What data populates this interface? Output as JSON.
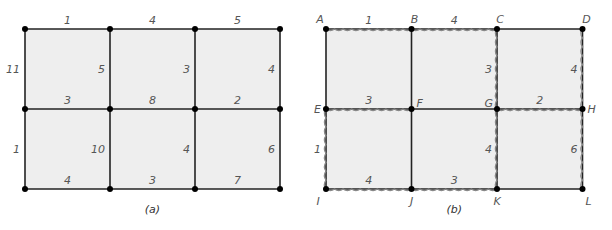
{
  "panels": [
    {
      "id": "a",
      "caption": "(a)",
      "origin": [
        25,
        29
      ],
      "cell_w": 85,
      "cell_h": 80,
      "cols": 3,
      "rows": 2,
      "node_labels": [],
      "horizontal_weights": [
        [
          "1",
          "4",
          "5"
        ],
        [
          "3",
          "8",
          "2"
        ],
        [
          "4",
          "3",
          "7"
        ]
      ],
      "vertical_weights": [
        [
          "11",
          "5",
          "3",
          "4"
        ],
        [
          "1",
          "10",
          "4",
          "6"
        ]
      ],
      "highlighted_h": [],
      "highlighted_v": []
    },
    {
      "id": "b",
      "caption": "(b)",
      "origin": [
        326,
        29
      ],
      "cell_w": 85.5,
      "cell_h": 80,
      "cols": 3,
      "rows": 2,
      "node_labels": [
        [
          "A",
          "B",
          "C",
          "D"
        ],
        [
          "E",
          "F",
          "G",
          "H"
        ],
        [
          "I",
          "J",
          "K",
          "L"
        ]
      ],
      "horizontal_weights": [
        [
          "1",
          "4",
          ""
        ],
        [
          "3",
          "",
          "2"
        ],
        [
          "4",
          "3",
          ""
        ]
      ],
      "vertical_weights": [
        [
          "",
          "",
          "3",
          "4"
        ],
        [
          "1",
          "",
          "4",
          "6"
        ]
      ],
      "highlighted_h": [
        [
          0,
          0
        ],
        [
          0,
          1
        ],
        [
          1,
          0
        ],
        [
          1,
          2
        ],
        [
          2,
          0
        ],
        [
          2,
          1
        ]
      ],
      "highlighted_v": [
        [
          0,
          2
        ],
        [
          0,
          3
        ],
        [
          1,
          0
        ],
        [
          1,
          2
        ],
        [
          1,
          3
        ]
      ]
    }
  ],
  "colors": {
    "cell_fill": "#eeeeee",
    "edge": "#222222",
    "node": "#000000",
    "wave": "#888888",
    "text": "#555555"
  }
}
